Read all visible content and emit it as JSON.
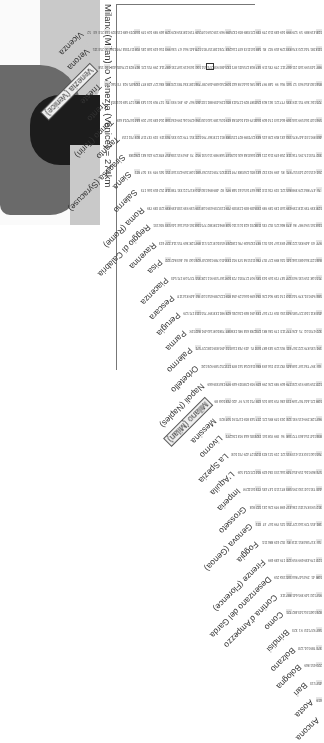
{
  "title": "Milano (Milan) to Venezia (Venice) = 274km",
  "highlight": {
    "from": "Milano (Milan)",
    "to": "Venezia (Venice)",
    "km": 274
  },
  "cities": [
    "Ancona",
    "Aosta",
    "Bari",
    "Bologna",
    "Bolzano",
    "Brindisi",
    "Como",
    "Cortina d'Ampezzo",
    "Desenzano del Garda",
    "Firenze (Florence)",
    "Foggia",
    "Genova (Genoa)",
    "Grosseto",
    "Imperia",
    "L'Aquila",
    "La Spezia",
    "Livorno",
    "Messina",
    "Milano (Milan)",
    "Napoli (Naples)",
    "Orbetello",
    "Palermo",
    "Parma",
    "Perugia",
    "Pescara",
    "Piacenza",
    "Pisa",
    "Ravenna",
    "Reggio di Calabria",
    "Roma (Rome)",
    "Salerno",
    "Siena",
    "Siracusa (Syracuse)",
    "Taranto",
    "Torino (Turin)",
    "Trento",
    "Trieste",
    "Venezia (Venice)",
    "Verona",
    "Vicenza"
  ],
  "boxed_cities": [
    "Milano (Milan)",
    "Venezia (Venice)"
  ],
  "stripe_every": 5,
  "map": {
    "description": "Map of Italy and surrounding region, grayscale"
  },
  "distances_sample": {
    "Milano (Milan)": {
      "Venezia (Venice)": 274,
      "Verona": 157,
      "Vicenza": 209,
      "Trieste": 409,
      "Torino (Turin)": 140
    },
    "Vicenza": {
      "Venezia (Venice)": 63,
      "Verona": 52,
      "Trieste": 213,
      "Trento": 144
    },
    "Verona": {
      "Venezia (Venice)": 115,
      "Trieste": 253,
      "Trento": 100
    },
    "Venezia (Venice)": {
      "Trieste": 158,
      "Trento": 166,
      "Torino (Turin)": 403
    },
    "Trieste": {
      "Trento": 282,
      "Torino (Turin)": 540
    },
    "Trento": {
      "Torino (Turin)": 353
    },
    "Ancona": {
      "Aosta": 619,
      "Bari": 457,
      "Bologna": 220,
      "Bolzano": 373,
      "Brindisi": 567
    }
  }
}
